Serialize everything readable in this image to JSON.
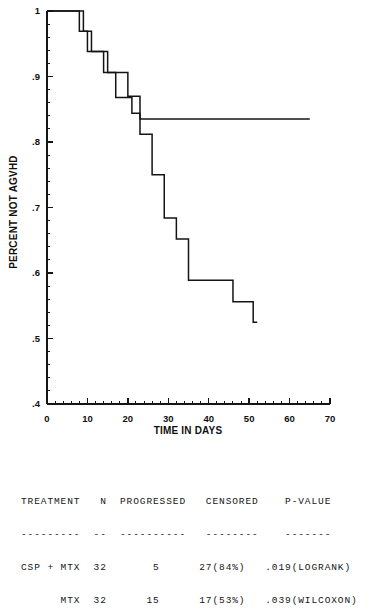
{
  "chart_data": {
    "type": "line",
    "subtype": "kaplan-meier-step",
    "title": "",
    "xlabel": "TIME IN DAYS",
    "ylabel": "PERCENT NOT AGVHD",
    "xlim": [
      0,
      70
    ],
    "ylim": [
      0.4,
      1.0
    ],
    "xticks": [
      0,
      10,
      20,
      30,
      40,
      50,
      60,
      70
    ],
    "xtick_labels": [
      "0",
      "10",
      "20",
      "30",
      "40",
      "50",
      "60",
      "70"
    ],
    "xtick_minor_step": 2,
    "yticks": [
      0.4,
      0.5,
      0.6,
      0.7,
      0.8,
      0.9,
      1.0
    ],
    "ytick_labels": [
      ".4",
      ".5",
      ".6",
      ".7",
      ".8",
      ".9",
      "1"
    ],
    "ytick_minor_step": 0.02,
    "grid": false,
    "legend": "none",
    "series": [
      {
        "name": "CSP + MTX",
        "points": [
          [
            0,
            1.0
          ],
          [
            8,
            1.0
          ],
          [
            8,
            0.969
          ],
          [
            10,
            0.969
          ],
          [
            10,
            0.938
          ],
          [
            15,
            0.938
          ],
          [
            15,
            0.906
          ],
          [
            20,
            0.906
          ],
          [
            20,
            0.87
          ],
          [
            23,
            0.87
          ],
          [
            23,
            0.835
          ],
          [
            65,
            0.835
          ]
        ]
      },
      {
        "name": "MTX",
        "points": [
          [
            0,
            1.0
          ],
          [
            9,
            1.0
          ],
          [
            9,
            0.969
          ],
          [
            11,
            0.969
          ],
          [
            11,
            0.938
          ],
          [
            14,
            0.938
          ],
          [
            14,
            0.906
          ],
          [
            17,
            0.906
          ],
          [
            17,
            0.868
          ],
          [
            21,
            0.868
          ],
          [
            21,
            0.844
          ],
          [
            23,
            0.844
          ],
          [
            23,
            0.812
          ],
          [
            26,
            0.812
          ],
          [
            26,
            0.75
          ],
          [
            29,
            0.75
          ],
          [
            29,
            0.684
          ],
          [
            32,
            0.684
          ],
          [
            32,
            0.652
          ],
          [
            35,
            0.652
          ],
          [
            35,
            0.589
          ],
          [
            46,
            0.589
          ],
          [
            46,
            0.556
          ],
          [
            51,
            0.556
          ],
          [
            51,
            0.525
          ],
          [
            52,
            0.525
          ]
        ]
      }
    ]
  },
  "stats_table": {
    "headers": [
      "TREATMENT",
      "N",
      "PROGRESSED",
      "CENSORED",
      "P-VALUE"
    ],
    "header_line": "TREATMENT   N  PROGRESSED   CENSORED    P-VALUE",
    "rule_line": "---------  --  ----------   --------    -------",
    "rows": [
      {
        "treatment": "CSP + MTX",
        "n": "32",
        "progressed": "5",
        "censored": "27(84%)",
        "p_value": ".019(LOGRANK)",
        "line": "CSP + MTX  32       5      27(84%)   .019(LOGRANK)"
      },
      {
        "treatment": "MTX",
        "n": "32",
        "progressed": "15",
        "censored": "17(53%)",
        "p_value": ".039(WILCOXON)",
        "line": "      MTX  32      15      17(53%)   .039(WILCOXON)"
      }
    ]
  },
  "colors": {
    "curve": "#141414",
    "axis": "#151515",
    "background": "#ffffff",
    "text": "#101010"
  }
}
